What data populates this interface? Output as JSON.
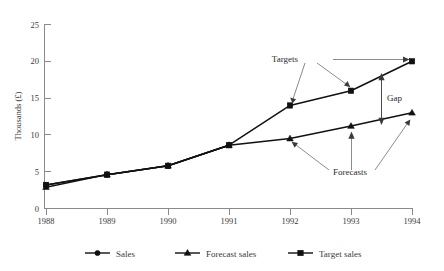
{
  "chart_data": {
    "type": "line",
    "title": "",
    "xlabel": "",
    "ylabel": "Thousands (£)",
    "categories": [
      "1988",
      "1989",
      "1990",
      "1991",
      "1992",
      "1993",
      "1994"
    ],
    "x": [
      1988,
      1989,
      1990,
      1991,
      1992,
      1993,
      1994
    ],
    "xlim": [
      1988,
      1994
    ],
    "ylim": [
      0,
      25
    ],
    "yticks": [
      "0",
      "5",
      "10",
      "15",
      "20",
      "25"
    ],
    "ytick_values": [
      0,
      5,
      10,
      15,
      20,
      25
    ],
    "grid": false,
    "legend_position": "bottom",
    "series": [
      {
        "name": "Sales",
        "marker": "circle",
        "color": "#111111",
        "x": [
          1988,
          1989,
          1990,
          1991
        ],
        "values": [
          3.2,
          4.6,
          5.8,
          8.6
        ]
      },
      {
        "name": "Forecast sales",
        "marker": "triangle",
        "color": "#111111",
        "x": [
          1988,
          1989,
          1990,
          1991,
          1992,
          1993,
          1994
        ],
        "values": [
          2.9,
          4.6,
          5.8,
          8.6,
          9.5,
          11.2,
          13.0
        ]
      },
      {
        "name": "Target sales",
        "marker": "square",
        "color": "#111111",
        "x": [
          1988,
          1989,
          1990,
          1991,
          1992,
          1993,
          1994
        ],
        "values": [
          3.2,
          4.6,
          5.8,
          8.6,
          14.0,
          16.0,
          20.0
        ]
      }
    ],
    "annotations": [
      {
        "text": "Targets",
        "points_to": [
          "target-1992",
          "target-1993",
          "target-1994"
        ]
      },
      {
        "text": "Gap",
        "points_to": [
          "target-1993-1994-band",
          "forecast-1993-1994-band"
        ]
      },
      {
        "text": "Forecasts",
        "points_to": [
          "forecast-1992",
          "forecast-1993",
          "forecast-1994"
        ]
      }
    ]
  },
  "axes": {
    "y_title": "Thousands (£)",
    "y_ticks": [
      "25",
      "20",
      "15",
      "10",
      "5",
      "0"
    ],
    "x_ticks": [
      "1988",
      "1989",
      "1990",
      "1991",
      "1992",
      "1993",
      "1994"
    ]
  },
  "annotations": {
    "targets": "Targets",
    "gap": "Gap",
    "forecasts": "Forecasts"
  },
  "legend": {
    "items": [
      {
        "label": "Sales",
        "marker": "circle"
      },
      {
        "label": "Forecast sales",
        "marker": "triangle"
      },
      {
        "label": "Target sales",
        "marker": "square"
      }
    ]
  },
  "colors": {
    "ink": "#111111",
    "axis": "#8a8a8a",
    "text": "#3a3a3a",
    "leader": "#6e6e6e",
    "background": "#ffffff"
  }
}
